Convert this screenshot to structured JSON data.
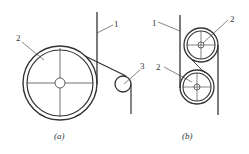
{
  "figure": {
    "panel_a": {
      "caption": "(a)",
      "labels": {
        "belt": "1",
        "drum": "2",
        "guide_roller": "3"
      }
    },
    "panel_b": {
      "caption": "(b)",
      "labels": {
        "belt": "1",
        "upper_drum": "2",
        "lower_drum": "2"
      }
    }
  },
  "colors": {
    "line": "#333333",
    "background": "#ffffff"
  }
}
